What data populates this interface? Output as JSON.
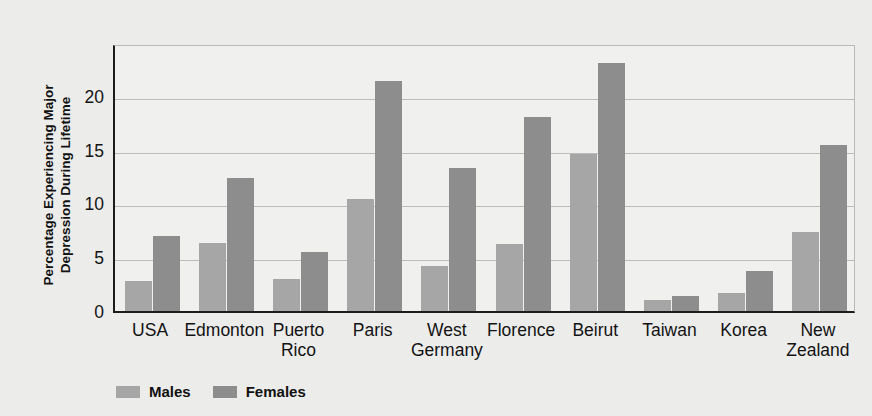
{
  "chart_data": {
    "type": "bar",
    "title": "",
    "xlabel": "",
    "ylabel": "Percentage Experiencing Major Depression During Lifetime",
    "ylabel_line1": "Percentage Experiencing Major",
    "ylabel_line2": "Depression During Lifetime",
    "categories": [
      "USA",
      "Edmonton",
      "Puerto Rico",
      "Paris",
      "West Germany",
      "Florence",
      "Beirut",
      "Taiwan",
      "Korea",
      "New Zealand"
    ],
    "category_lines": [
      [
        "USA",
        ""
      ],
      [
        "Edmonton",
        ""
      ],
      [
        "Puerto",
        "Rico"
      ],
      [
        "Paris",
        ""
      ],
      [
        "West",
        "Germany"
      ],
      [
        "Florence",
        ""
      ],
      [
        "Beirut",
        ""
      ],
      [
        "Taiwan",
        ""
      ],
      [
        "Korea",
        ""
      ],
      [
        "New",
        "Zealand"
      ]
    ],
    "series": [
      {
        "name": "Males",
        "color": "#a6a6a6",
        "values": [
          2.8,
          6.3,
          3.0,
          10.4,
          4.2,
          6.2,
          14.6,
          1.0,
          1.7,
          7.3
        ]
      },
      {
        "name": "Females",
        "color": "#8d8d8d",
        "values": [
          7.0,
          12.4,
          5.5,
          21.4,
          13.3,
          18.0,
          23.0,
          1.4,
          3.7,
          15.4
        ]
      }
    ],
    "yticks": [
      0,
      5,
      10,
      15,
      20
    ],
    "ylim": [
      0,
      24.9
    ],
    "grid": true,
    "legend_position": "bottom-left"
  },
  "legend": {
    "items": [
      {
        "label": "Males",
        "color": "#a6a6a6"
      },
      {
        "label": "Females",
        "color": "#8d8d8d"
      }
    ]
  },
  "colors": {
    "background": "#ececeb",
    "plot_background": "#f0f0ef",
    "axis": "#1c1c1c",
    "gridline": "#bcbcba",
    "males": "#a6a6a6",
    "females": "#8d8d8d"
  }
}
